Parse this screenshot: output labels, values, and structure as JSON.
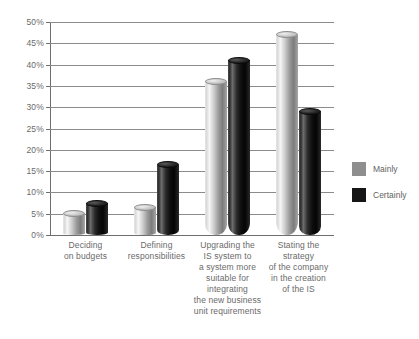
{
  "chart_data": {
    "type": "bar",
    "title": "",
    "subtitle": "",
    "xlabel": "",
    "ylabel": "",
    "ylim": [
      0,
      50
    ],
    "ytick_labels": [
      "0%",
      "5%",
      "10%",
      "15%",
      "20%",
      "25%",
      "30%",
      "35%",
      "40%",
      "45%",
      "50%"
    ],
    "ytick_values": [
      0,
      5,
      10,
      15,
      20,
      25,
      30,
      35,
      40,
      45,
      50
    ],
    "grid": true,
    "legend_position": "right",
    "categories": [
      "Deciding\non budgets",
      "Defining\nresponsibilities",
      "Upgrading the\nIS system to\na system more\nsuitable for\nintegrating\nthe new business\nunit requirements",
      "Stating the\nstrategy\nof the company\nin the creation\nof the IS"
    ],
    "series": [
      {
        "name": "Mainly",
        "color": "#8e8e8e",
        "values": [
          5,
          6.5,
          36,
          47
        ]
      },
      {
        "name": "Certainly",
        "color": "#161616",
        "values": [
          7.5,
          16.5,
          41,
          29
        ]
      }
    ]
  },
  "legend": {
    "items": [
      {
        "label": "Mainly"
      },
      {
        "label": "Certainly"
      }
    ]
  }
}
